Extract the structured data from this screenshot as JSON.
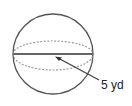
{
  "diagram": {
    "shape": "sphere",
    "radius_label": "5 yd",
    "colors": {
      "stroke": "#555555",
      "dashed": "#999999",
      "radius": "#444444"
    }
  }
}
